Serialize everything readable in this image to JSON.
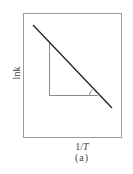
{
  "diagram": {
    "y_axis_label": "lnk",
    "x_axis_label_prefix": "1/",
    "x_axis_label_var": "T",
    "caption": "(a)",
    "frame": {
      "x": 23,
      "y": 13,
      "width": 99,
      "height": 125
    },
    "line": {
      "x1": 33,
      "y1": 25,
      "x2": 112,
      "y2": 108
    },
    "triangle": {
      "vertical_leg": {
        "x": 49,
        "y1": 42,
        "y2": 95
      },
      "horizontal_leg": {
        "y": 95,
        "x1": 49,
        "x2": 98
      }
    },
    "angle_marker": {
      "cx": 97,
      "cy": 95,
      "r": 7
    },
    "colors": {
      "frame": "#9a9a9a",
      "line": "#222222",
      "triangle": "#8a8a8a"
    }
  }
}
